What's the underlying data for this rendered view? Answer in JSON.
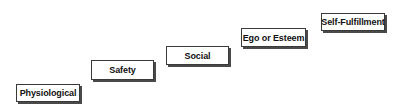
{
  "diagram": {
    "type": "staircase",
    "steps": [
      {
        "label": "Physiological"
      },
      {
        "label": "Safety"
      },
      {
        "label": "Social"
      },
      {
        "label": "Ego or Esteem"
      },
      {
        "label": "Self-Fulfillment"
      }
    ]
  }
}
